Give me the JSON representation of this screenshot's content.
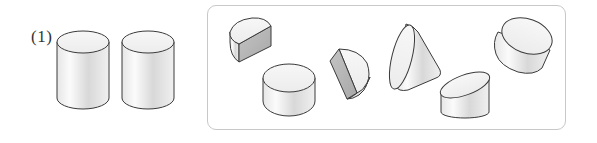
{
  "problem": {
    "label": "(1)",
    "given_solids": [
      {
        "id": "cylinder-a",
        "type": "cylinder"
      },
      {
        "id": "cylinder-b",
        "type": "cylinder"
      }
    ]
  },
  "options_box": {
    "solids": [
      {
        "id": "half-cylinder",
        "type": "half-cylinder",
        "orientation": "upright"
      },
      {
        "id": "short-cylinder",
        "type": "cylinder",
        "orientation": "upright"
      },
      {
        "id": "half-cylinder-standing",
        "type": "half-cylinder",
        "orientation": "standing-on-cut-face"
      },
      {
        "id": "oblique-cut-cylinder-tilted",
        "type": "obliquely-cut-cylinder",
        "orientation": "tilted"
      },
      {
        "id": "oblique-cut-cylinder-upright",
        "type": "obliquely-cut-cylinder",
        "orientation": "upright"
      },
      {
        "id": "tilted-cylinder",
        "type": "cylinder",
        "orientation": "tilted"
      }
    ]
  },
  "colors": {
    "outline": "#3a3a3a",
    "face_light": "#f2f2f2",
    "face_dark": "#b5b5b5",
    "frame_border": "#c8c8c8"
  }
}
